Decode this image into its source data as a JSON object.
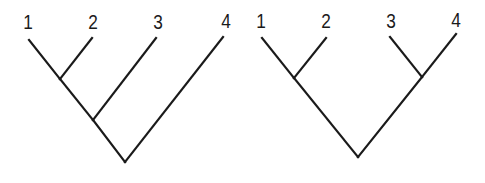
{
  "diagram": {
    "type": "cladograms",
    "line_color": "#1a1a1a",
    "background": "#ffffff",
    "trees": [
      {
        "id": "left-tree",
        "topology": "(((1,2),3),4)",
        "description": "Pectinate / ladder tree",
        "taxa": [
          {
            "label": "1",
            "lx": 28,
            "ly": 21,
            "tip": [
              29,
              40
            ]
          },
          {
            "label": "2",
            "lx": 93,
            "ly": 21,
            "tip": [
              92,
              38
            ]
          },
          {
            "label": "3",
            "lx": 158,
            "ly": 21,
            "tip": [
              156,
              38
            ]
          },
          {
            "label": "4",
            "lx": 226,
            "ly": 20,
            "tip": [
              223,
              37
            ]
          }
        ],
        "nodes": {
          "n12": [
            60,
            79
          ],
          "n123": [
            93,
            120
          ],
          "root": [
            125,
            162
          ]
        },
        "edges": [
          [
            "tip0",
            "n12"
          ],
          [
            "tip1",
            "n12"
          ],
          [
            "n12",
            "n123"
          ],
          [
            "tip2",
            "n123"
          ],
          [
            "n123",
            "root"
          ],
          [
            "tip3",
            "root"
          ]
        ]
      },
      {
        "id": "right-tree",
        "topology": "((1,2),(3,4))",
        "description": "Balanced / symmetric tree",
        "taxa": [
          {
            "label": "1",
            "lx": 261,
            "ly": 20,
            "tip": [
              262,
              38
            ]
          },
          {
            "label": "2",
            "lx": 326,
            "ly": 20,
            "tip": [
              326,
              38
            ]
          },
          {
            "label": "3",
            "lx": 391,
            "ly": 20,
            "tip": [
              390,
              37
            ]
          },
          {
            "label": "4",
            "lx": 456,
            "ly": 19,
            "tip": [
              456,
              34
            ]
          }
        ],
        "nodes": {
          "n12": [
            294,
            78
          ],
          "n34": [
            422,
            77
          ],
          "root": [
            358,
            157
          ]
        },
        "edges": [
          [
            "tip0",
            "n12"
          ],
          [
            "tip1",
            "n12"
          ],
          [
            "tip2",
            "n34"
          ],
          [
            "tip3",
            "n34"
          ],
          [
            "n12",
            "root"
          ],
          [
            "n34",
            "root"
          ]
        ]
      }
    ]
  }
}
